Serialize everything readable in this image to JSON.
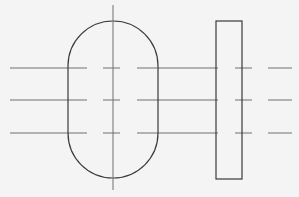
{
  "drawing": {
    "background": "#f4f4f4",
    "outline_color": "#3a3a3a",
    "centerline_color": "#707070",
    "stadium": {
      "x": 68,
      "y": 21,
      "width": 90,
      "height": 157,
      "radius": 45
    },
    "rectangle": {
      "x": 216,
      "y": 21,
      "width": 26,
      "height": 158
    },
    "vertical_centerline": {
      "x": 113,
      "y1": 5,
      "y2": 190
    },
    "horizontal_centerlines_y": [
      68,
      100,
      133
    ],
    "horizontal_segments_x": [
      [
        10,
        87
      ],
      [
        103,
        120
      ],
      [
        137,
        218
      ],
      [
        235,
        252
      ],
      [
        268,
        292
      ]
    ]
  }
}
